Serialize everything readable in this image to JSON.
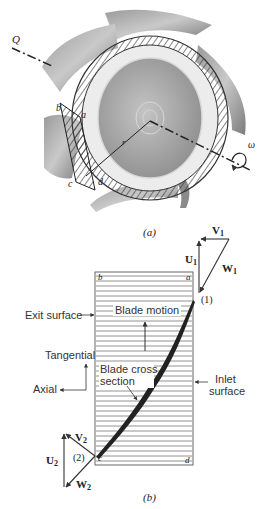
{
  "figure_a": {
    "caption": "(a)",
    "labels": {
      "flow": "Q",
      "rotation": "ω",
      "radius": "r",
      "corner_a": "a",
      "corner_b": "b",
      "corner_c": "c",
      "corner_d": "d"
    },
    "colors": {
      "blade": "#8e8e8e",
      "blade_light": "#b8b8b8",
      "hub": "#a9a9a9",
      "hatch": "#333333"
    }
  },
  "figure_b": {
    "caption": "(b)",
    "corners": {
      "a": "a",
      "b": "b",
      "c": "c",
      "d": "d"
    },
    "labels": {
      "exit_surface": "Exit surface",
      "inlet_surface_line1": "Inlet",
      "inlet_surface_line2": "surface",
      "blade_motion": "Blade motion",
      "blade_cross_section_line1": "Blade cross",
      "blade_cross_section_line2": "section",
      "tangential": "Tangential",
      "axial": "Axial"
    },
    "inlet_triangle": {
      "point": "(1)",
      "V": "V",
      "V_sub": "1",
      "U": "U",
      "U_sub": "1",
      "W": "W",
      "W_sub": "1"
    },
    "outlet_triangle": {
      "point": "(2)",
      "V": "V",
      "V_sub": "2",
      "U": "U",
      "U_sub": "2",
      "W": "W",
      "W_sub": "2"
    },
    "colors": {
      "lines": "#666666",
      "blade": "#222222"
    }
  }
}
